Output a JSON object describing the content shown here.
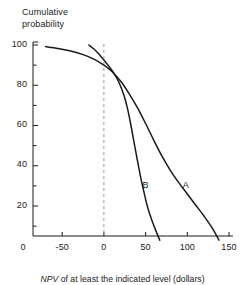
{
  "chart_data": {
    "type": "line",
    "title": "",
    "ylabel": "Cumulative\nprobability",
    "xlabel_italic": "NPV",
    "xlabel_rest": " of at least the indicated level (dollars)",
    "xlabel_full": "NPV of at least the indicated level (dollars)",
    "xlim": [
      -85,
      160
    ],
    "ylim": [
      0,
      104
    ],
    "xticks": [
      -50,
      0,
      50,
      100,
      150
    ],
    "xtick_labels": [
      "-50",
      "0",
      "50",
      "100",
      "150"
    ],
    "x_origin_label": "0",
    "yticks": [
      20,
      40,
      60,
      80,
      100
    ],
    "ytick_labels": [
      "20",
      "40",
      "60",
      "80",
      "100"
    ],
    "y_minor_ticks": [
      10,
      30,
      50,
      70,
      90
    ],
    "grid": false,
    "legend": "inline-curve-labels",
    "axis_color": "#1a1a1a",
    "curve_color": "#1a1a1a",
    "reference_line": {
      "name": "zero-npv-reference",
      "x": 0,
      "style": "dashed",
      "color": "#9a9a9a"
    },
    "series": [
      {
        "name": "A",
        "label": "A",
        "label_x": 98,
        "label_y": 30,
        "points": [
          {
            "x": -70,
            "y": 99.2
          },
          {
            "x": -55,
            "y": 98.3
          },
          {
            "x": -40,
            "y": 97.0
          },
          {
            "x": -25,
            "y": 95.2
          },
          {
            "x": -12,
            "y": 93.0
          },
          {
            "x": 0,
            "y": 90.0
          },
          {
            "x": 8,
            "y": 87.5
          },
          {
            "x": 15,
            "y": 84.5
          },
          {
            "x": 22,
            "y": 81.0
          },
          {
            "x": 30,
            "y": 76.0
          },
          {
            "x": 40,
            "y": 69.0
          },
          {
            "x": 50,
            "y": 61.0
          },
          {
            "x": 60,
            "y": 52.5
          },
          {
            "x": 70,
            "y": 44.5
          },
          {
            "x": 80,
            "y": 37.5
          },
          {
            "x": 90,
            "y": 31.5
          },
          {
            "x": 100,
            "y": 26.0
          },
          {
            "x": 110,
            "y": 20.5
          },
          {
            "x": 120,
            "y": 15.0
          },
          {
            "x": 130,
            "y": 9.0
          },
          {
            "x": 138,
            "y": 3.0
          }
        ]
      },
      {
        "name": "B",
        "label": "B",
        "label_x": 50,
        "label_y": 30,
        "points": [
          {
            "x": -18,
            "y": 100.0
          },
          {
            "x": -12,
            "y": 98.0
          },
          {
            "x": -6,
            "y": 95.5
          },
          {
            "x": 0,
            "y": 92.5
          },
          {
            "x": 6,
            "y": 89.5
          },
          {
            "x": 12,
            "y": 86.0
          },
          {
            "x": 18,
            "y": 81.5
          },
          {
            "x": 24,
            "y": 75.0
          },
          {
            "x": 28,
            "y": 69.0
          },
          {
            "x": 32,
            "y": 61.0
          },
          {
            "x": 36,
            "y": 52.0
          },
          {
            "x": 40,
            "y": 43.0
          },
          {
            "x": 44,
            "y": 34.5
          },
          {
            "x": 48,
            "y": 27.0
          },
          {
            "x": 52,
            "y": 20.0
          },
          {
            "x": 57,
            "y": 13.5
          },
          {
            "x": 62,
            "y": 8.0
          },
          {
            "x": 67,
            "y": 3.0
          }
        ]
      }
    ]
  }
}
